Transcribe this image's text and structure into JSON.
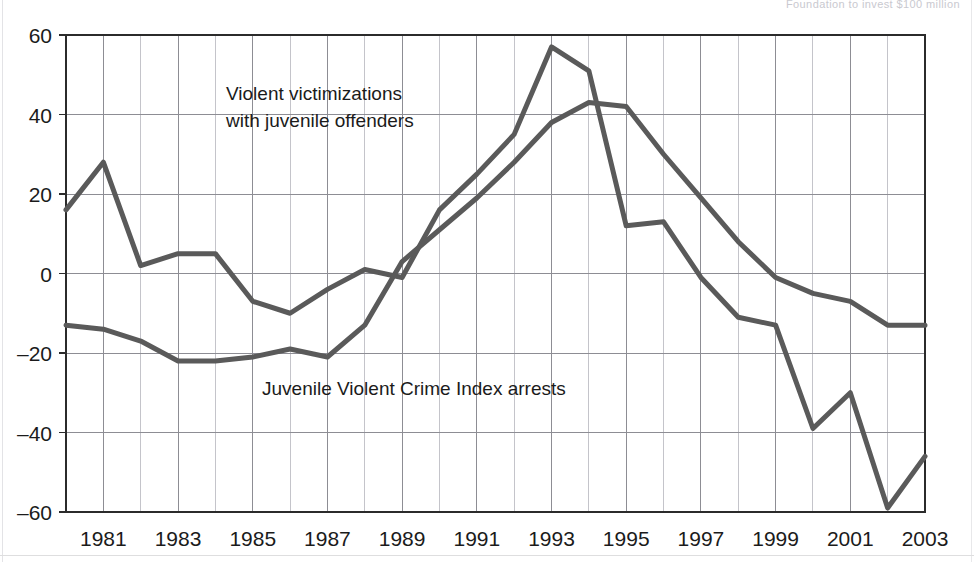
{
  "header": {
    "faint_text": "Foundation to invest $100 million"
  },
  "chart_data": {
    "type": "line",
    "title": "",
    "subtitle": "",
    "xlabel": "",
    "ylabel": "",
    "xlim": [
      1980,
      2003
    ],
    "ylim": [
      -60,
      60
    ],
    "grid": true,
    "legend_position": "inline-annotation",
    "y_ticks": [
      60,
      40,
      20,
      0,
      -20,
      -40,
      -60
    ],
    "y_tick_labels": [
      "60",
      "40",
      "20",
      "0",
      "–20",
      "–40",
      "–60"
    ],
    "x_ticks": [
      1981,
      1983,
      1985,
      1987,
      1989,
      1991,
      1993,
      1995,
      1997,
      1999,
      2001,
      2003
    ],
    "x_tick_labels": [
      "1981",
      "1983",
      "1985",
      "1987",
      "1989",
      "1991",
      "1993",
      "1995",
      "1997",
      "1999",
      "2001",
      "2003"
    ],
    "x": [
      1980,
      1981,
      1982,
      1983,
      1984,
      1985,
      1986,
      1987,
      1988,
      1989,
      1990,
      1991,
      1992,
      1993,
      1994,
      1995,
      1996,
      1997,
      1998,
      1999,
      2000,
      2001,
      2002,
      2003
    ],
    "series": [
      {
        "name": "Violent victimizations with juvenile offenders",
        "color": "#5a5a5a",
        "annotation": "Violent victimizations\nwith juvenile offenders",
        "annotation_lines": [
          "Violent victimizations",
          "with juvenile offenders"
        ],
        "values": [
          16,
          28,
          2,
          5,
          5,
          -7,
          -10,
          -4,
          1,
          -1,
          16,
          25,
          35,
          57,
          51,
          12,
          13,
          -1,
          -11,
          -13,
          -39,
          -30,
          -59,
          -46
        ]
      },
      {
        "name": "Juvenile Violent Crime Index arrests",
        "color": "#5a5a5a",
        "annotation": "Juvenile Violent Crime Index arrests",
        "annotation_lines": [
          "Juvenile Violent Crime Index arrests"
        ],
        "values": [
          -13,
          -14,
          -17,
          -22,
          -22,
          -21,
          -19,
          -21,
          -13,
          3,
          11,
          19,
          28,
          38,
          43,
          42,
          30,
          19,
          8,
          -1,
          -5,
          -7,
          -13,
          -13
        ]
      }
    ],
    "axis_color": "#2b2b2b",
    "gridline_color": "#9a9aa0",
    "background": "#ffffff"
  },
  "annotations": [
    {
      "name": "violent-victimizations-label",
      "lines": [
        "Violent victimizations",
        "with juvenile offenders"
      ],
      "x": 226,
      "y": 100
    },
    {
      "name": "juvenile-arrests-label",
      "lines": [
        "Juvenile Violent Crime Index arrests"
      ],
      "x": 262,
      "y": 395
    }
  ]
}
